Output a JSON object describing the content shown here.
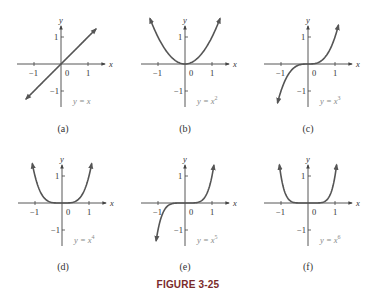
{
  "figure_title": "FIGURE 3-25",
  "colors": {
    "curve": "#555555",
    "axis": "#444444",
    "label": "#333333",
    "eqn": "#888888",
    "title": "#7a2a2a"
  },
  "chart_data": [
    {
      "type": "line",
      "panel": "(a)",
      "equation": "y = x",
      "exponent": 1,
      "xlabel": "x",
      "ylabel": "y",
      "xticks": [
        -1,
        0,
        1
      ],
      "yticks": [
        1,
        -1
      ],
      "xlim": [
        -1.3,
        1.3
      ],
      "ylim": [
        -1.6,
        1.6
      ],
      "x": [
        -1.3,
        1.3
      ],
      "y": [
        -1.3,
        1.3
      ]
    },
    {
      "type": "line",
      "panel": "(b)",
      "equation": "y = x^2",
      "exponent": 2,
      "xlabel": "x",
      "ylabel": "y",
      "xticks": [
        -1,
        0,
        1
      ],
      "yticks": [
        1,
        -1
      ],
      "xlim": [
        -1.3,
        1.3
      ],
      "ylim": [
        -1.6,
        1.6
      ],
      "x": [
        -1.3,
        -1,
        -0.5,
        0,
        0.5,
        1,
        1.3
      ],
      "y": [
        1.69,
        1,
        0.25,
        0,
        0.25,
        1,
        1.69
      ]
    },
    {
      "type": "line",
      "panel": "(c)",
      "equation": "y = x^3",
      "exponent": 3,
      "xlabel": "x",
      "ylabel": "y",
      "xticks": [
        -1,
        0,
        1
      ],
      "yticks": [
        1,
        -1
      ],
      "xlim": [
        -1.3,
        1.3
      ],
      "ylim": [
        -1.6,
        1.6
      ],
      "x": [
        -1.13,
        -1,
        -0.5,
        0,
        0.5,
        1,
        1.13
      ],
      "y": [
        -1.44,
        -1,
        -0.125,
        0,
        0.125,
        1,
        1.44
      ]
    },
    {
      "type": "line",
      "panel": "(d)",
      "equation": "y = x^4",
      "exponent": 4,
      "xlabel": "x",
      "ylabel": "y",
      "xticks": [
        -1,
        0,
        1
      ],
      "yticks": [
        1,
        -1
      ],
      "xlim": [
        -1.3,
        1.3
      ],
      "ylim": [
        -1.6,
        1.6
      ],
      "x": [
        -1.1,
        -1,
        -0.5,
        0,
        0.5,
        1,
        1.1
      ],
      "y": [
        1.46,
        1,
        0.0625,
        0,
        0.0625,
        1,
        1.46
      ]
    },
    {
      "type": "line",
      "panel": "(e)",
      "equation": "y = x^5",
      "exponent": 5,
      "xlabel": "x",
      "ylabel": "y",
      "xticks": [
        -1,
        0,
        1
      ],
      "yticks": [
        1,
        -1
      ],
      "xlim": [
        -1.3,
        1.3
      ],
      "ylim": [
        -1.6,
        1.6
      ],
      "x": [
        -1.07,
        -1,
        -0.5,
        0,
        0.5,
        1,
        1.07
      ],
      "y": [
        -1.4,
        -1,
        -0.03,
        0,
        0.03,
        1,
        1.4
      ]
    },
    {
      "type": "line",
      "panel": "(f)",
      "equation": "y = x^6",
      "exponent": 6,
      "xlabel": "x",
      "ylabel": "y",
      "xticks": [
        -1,
        0,
        1
      ],
      "yticks": [
        1,
        -1
      ],
      "xlim": [
        -1.3,
        1.3
      ],
      "ylim": [
        -1.6,
        1.6
      ],
      "x": [
        -1.06,
        -1,
        -0.5,
        0,
        0.5,
        1,
        1.06
      ],
      "y": [
        1.42,
        1,
        0.016,
        0,
        0.016,
        1,
        1.42
      ]
    }
  ],
  "captions": [
    "(a)",
    "(b)",
    "(c)",
    "(d)",
    "(e)",
    "(f)"
  ],
  "tick_labels": {
    "x_neg": "−1",
    "x_zero": "0",
    "x_pos": "1",
    "y_pos": "1",
    "y_neg": "−1"
  }
}
